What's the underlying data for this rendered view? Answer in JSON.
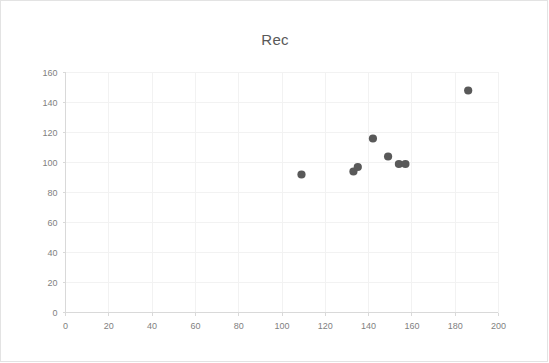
{
  "chart_data": {
    "type": "scatter",
    "title": "Rec",
    "xlabel": "",
    "ylabel": "",
    "xlim": [
      0,
      200
    ],
    "ylim": [
      0,
      160
    ],
    "x_ticks": [
      0,
      20,
      40,
      60,
      80,
      100,
      120,
      140,
      160,
      180,
      200
    ],
    "y_ticks": [
      0,
      20,
      40,
      60,
      80,
      100,
      120,
      140,
      160
    ],
    "grid": true,
    "legend": false,
    "series": [
      {
        "name": "Rec",
        "marker_color": "#595959",
        "points": [
          {
            "x": 109,
            "y": 92
          },
          {
            "x": 133,
            "y": 94
          },
          {
            "x": 135,
            "y": 97
          },
          {
            "x": 142,
            "y": 116
          },
          {
            "x": 149,
            "y": 104
          },
          {
            "x": 154,
            "y": 99
          },
          {
            "x": 157,
            "y": 99
          },
          {
            "x": 186,
            "y": 148
          }
        ]
      }
    ]
  },
  "colors": {
    "marker": "#595959",
    "grid": "#f2f2f2",
    "axis": "#d9d9d9",
    "tick_text": "#7f7f7f",
    "title_text": "#595959",
    "frame_border": "#e3e3e3",
    "background": "#ffffff"
  }
}
